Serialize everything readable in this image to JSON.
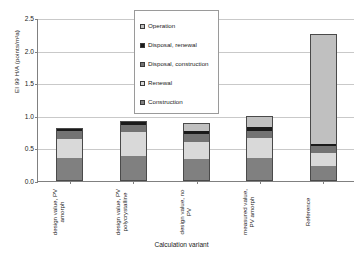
{
  "chart_data": {
    "type": "bar",
    "subtype": "stacked",
    "title": "",
    "xlabel": "Calculation variant",
    "ylabel": "EI 99 H/A (points/m²a)",
    "ylim": [
      0.0,
      2.5
    ],
    "yticks": [
      "0.0",
      "0.5",
      "1.0",
      "1.5",
      "2.0",
      "2.5"
    ],
    "ytick_values": [
      0.0,
      0.5,
      1.0,
      1.5,
      2.0,
      2.5
    ],
    "grid": "horizontal",
    "legend_position": "upper-center",
    "categories": [
      "design value, PV amorph",
      "design value, PV polycrystalline",
      "design value, no PV",
      "measured value, PV amorph",
      "Reference"
    ],
    "series": [
      {
        "name": "Construction",
        "color": "#808080",
        "values": [
          0.36,
          0.39,
          0.345,
          0.36,
          0.235
        ]
      },
      {
        "name": "Renewal",
        "color": "#d9d9d9",
        "values": [
          0.285,
          0.355,
          0.255,
          0.305,
          0.19
        ]
      },
      {
        "name": "Disposal, construction",
        "color": "#737373",
        "values": [
          0.115,
          0.11,
          0.115,
          0.105,
          0.11
        ]
      },
      {
        "name": "Disposal, renewal",
        "color": "#1a1a1a",
        "values": [
          0.055,
          0.065,
          0.06,
          0.055,
          0.03
        ]
      },
      {
        "name": "Operation",
        "color": "#c0c0c0",
        "values": [
          0.0,
          0.0,
          0.12,
          0.17,
          1.69
        ]
      }
    ],
    "totals": [
      0.815,
      0.92,
      0.895,
      0.995,
      2.255
    ]
  },
  "legend": {
    "items": [
      {
        "label": "Operation",
        "swatch": "#c0c0c0"
      },
      {
        "label": "Disposal, renewal",
        "swatch": "#1a1a1a"
      },
      {
        "label": "Disposal, construction",
        "swatch": "#737373"
      },
      {
        "label": "Renewal",
        "swatch": "#d9d9d9"
      },
      {
        "label": "Construction",
        "swatch": "#808080"
      }
    ]
  }
}
